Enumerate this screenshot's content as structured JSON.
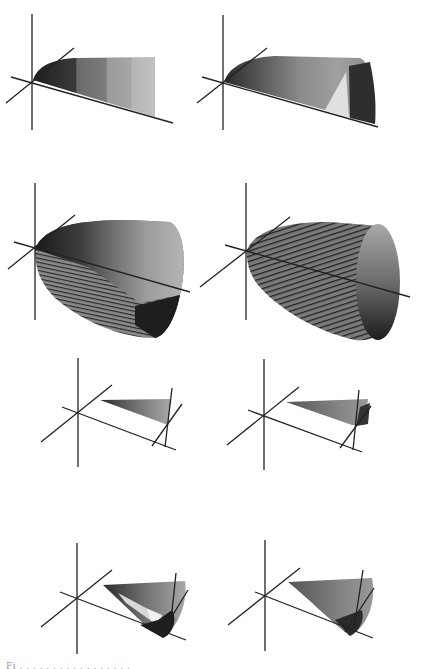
{
  "figure": {
    "panel_count": 8,
    "layout": "4 rows x 2 columns",
    "panels": [
      {
        "id": "a",
        "row": 1,
        "col": 1,
        "description": "partial shaded surface patch, banded grey shading"
      },
      {
        "id": "b",
        "row": 1,
        "col": 2,
        "description": "partial shaded surface patch with light triangular facet and dark end"
      },
      {
        "id": "c",
        "row": 2,
        "col": 1,
        "description": "paraboloid-like shaded solid with banded facets"
      },
      {
        "id": "d",
        "row": 2,
        "col": 2,
        "description": "paraboloid-like solid with fine striped shading and shaded end cap"
      },
      {
        "id": "e",
        "row": 3,
        "col": 1,
        "description": "thin shaded wedge with secondary axis frame"
      },
      {
        "id": "f",
        "row": 3,
        "col": 2,
        "description": "thin shaded wedge with secondary axis frame, dark tip"
      },
      {
        "id": "g",
        "row": 4,
        "col": 1,
        "description": "shaded cone with light and dark facets"
      },
      {
        "id": "h",
        "row": 4,
        "col": 2,
        "description": "shaded cone, smooth grey shading"
      }
    ],
    "colors": {
      "axis": "#222222",
      "dark": "#2a2a2a",
      "mid": "#6e6e6e",
      "light": "#b8b8b8",
      "highlight": "#e2e2e2"
    }
  },
  "caption": {
    "text": "Fi . . . . . . . . . . . . . . . . ."
  }
}
